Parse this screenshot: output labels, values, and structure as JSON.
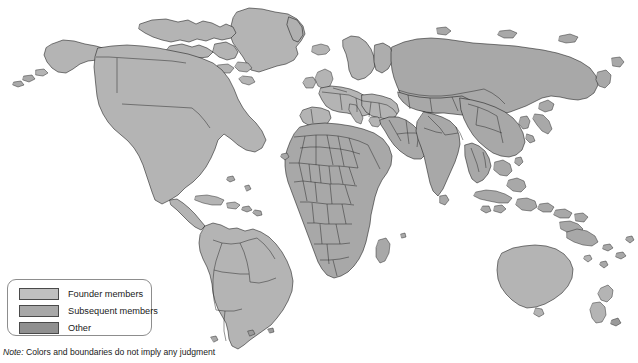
{
  "figure": {
    "type": "world-map",
    "title": "",
    "background_color": "#ffffff",
    "ocean_color": "#ffffff",
    "border_color": "#161616",
    "projection": "equirectangular-world"
  },
  "legend": {
    "box_border_color": "#8d8d8d",
    "items": [
      {
        "label": "Founder members",
        "color": "#c0c0c0",
        "swatch_name": "legend-swatch-founder"
      },
      {
        "label": "Subsequent members",
        "color": "#a8a8a8",
        "swatch_name": "legend-swatch-subsequent"
      },
      {
        "label": "Other",
        "color": "#909090",
        "swatch_name": "legend-swatch-other"
      }
    ]
  },
  "note": {
    "keyword": "Note:",
    "text": " Colors and boundaries do not imply any judgment"
  },
  "regions": {
    "north_america": "Founder members",
    "south_america": "Founder members",
    "europe": "Founder members",
    "africa": "Subsequent members",
    "asia": "Subsequent members",
    "oceania": "Founder members"
  }
}
